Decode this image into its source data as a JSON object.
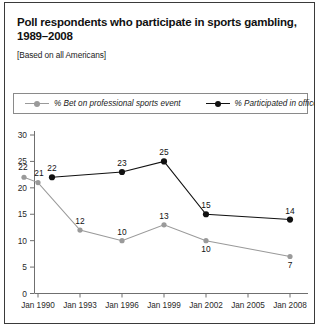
{
  "header": {
    "title": "Poll respondents who participate in sports gambling, 1989–2008",
    "subtitle": "[Based on all Americans]"
  },
  "legend": {
    "entries": [
      {
        "label": "% Bet on professional sports event",
        "marker": "circle-gray",
        "color": "#9a9a9a"
      },
      {
        "label": "% Participated in office pool",
        "marker": "circle-black",
        "color": "#111111"
      }
    ]
  },
  "footer": {
    "clipped_text": ""
  },
  "chart_data": {
    "type": "line",
    "title": "Poll respondents who participate in sports gambling, 1989–2008",
    "subtitle": "[Based on all Americans]",
    "xlabel": "",
    "ylabel": "",
    "ylim": [
      0,
      30
    ],
    "ytick_values": [
      0,
      5,
      10,
      15,
      20,
      25,
      30
    ],
    "ytick_labels": [
      "0",
      "5",
      "10",
      "15",
      "20",
      "25",
      "30"
    ],
    "xtick_labels": [
      "Jan 1990",
      "Jan 1993",
      "Jan 1996",
      "Jan 1999",
      "Jan 2002",
      "Jan 2005",
      "Jan 2008"
    ],
    "grid": false,
    "legend_position": "top",
    "series": [
      {
        "name": "% Bet on professional sports event",
        "color": "#9a9a9a",
        "marker": "circle-gray",
        "points": [
          {
            "x": "Jan 1989",
            "value": 22,
            "label": "22",
            "label_pos": "above-left"
          },
          {
            "x": "Jan 1990",
            "value": 21,
            "label": "21",
            "label_pos": "above-right"
          },
          {
            "x": "Jan 1993",
            "value": 12,
            "label": "12",
            "label_pos": "above"
          },
          {
            "x": "Jan 1996",
            "value": 10,
            "label": "10",
            "label_pos": "above"
          },
          {
            "x": "Jan 1999",
            "value": 13,
            "label": "13",
            "label_pos": "above"
          },
          {
            "x": "Jan 2002",
            "value": 10,
            "label": "10",
            "label_pos": "below"
          },
          {
            "x": "Jan 2008",
            "value": 7,
            "label": "7",
            "label_pos": "below"
          }
        ]
      },
      {
        "name": "% Participated in office pool",
        "color": "#111111",
        "marker": "circle-black",
        "points": [
          {
            "x": "Jan 1991",
            "value": 22,
            "label": "22",
            "label_pos": "above"
          },
          {
            "x": "Jan 1996",
            "value": 23,
            "label": "23",
            "label_pos": "above"
          },
          {
            "x": "Jan 1999",
            "value": 25,
            "label": "25",
            "label_pos": "above"
          },
          {
            "x": "Jan 2002",
            "value": 15,
            "label": "15",
            "label_pos": "above"
          },
          {
            "x": "Jan 2008",
            "value": 14,
            "label": "14",
            "label_pos": "above"
          }
        ]
      }
    ]
  }
}
